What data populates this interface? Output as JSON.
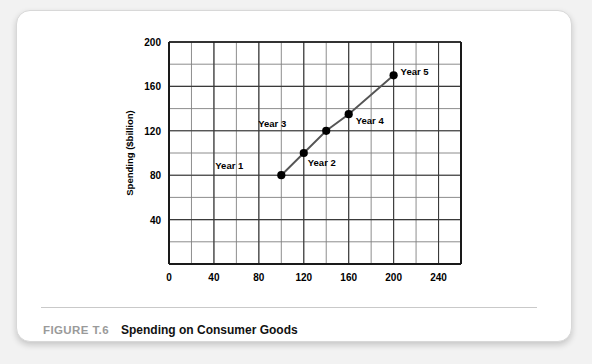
{
  "caption": {
    "figure_number": "FIGURE T.6",
    "title": "Spending on Consumer Goods"
  },
  "chart_data": {
    "type": "line",
    "title": "Spending on Consumer Goods",
    "xlabel": "Disposable income ($billion)",
    "ylabel": "Spending ($billion)",
    "xlim": [
      0,
      260
    ],
    "ylim": [
      0,
      200
    ],
    "xticks": [
      0,
      40,
      80,
      120,
      160,
      200,
      240
    ],
    "yticks": [
      0,
      40,
      80,
      120,
      160,
      200
    ],
    "xtick_labels": [
      "0",
      "40",
      "80",
      "120",
      "160",
      "200",
      "240"
    ],
    "ytick_labels": [
      "0",
      "40",
      "80",
      "120",
      "160",
      "200"
    ],
    "x_minor_step": 20,
    "y_minor_step": 20,
    "grid": true,
    "legend": false,
    "marker": "filled-circle",
    "line_color": "#555555",
    "marker_color": "#000000",
    "grid_color": "#808080",
    "axis_color": "#1a1a1a",
    "points": [
      {
        "label": "Year 1",
        "x": 100,
        "y": 80,
        "label_dx": -38,
        "label_dy": -6
      },
      {
        "label": "Year 2",
        "x": 120,
        "y": 100,
        "label_dx": 4,
        "label_dy": 13
      },
      {
        "label": "Year 3",
        "x": 140,
        "y": 120,
        "label_dx": -40,
        "label_dy": -4
      },
      {
        "label": "Year 4",
        "x": 160,
        "y": 135,
        "label_dx": 7,
        "label_dy": 10
      },
      {
        "label": "Year 5",
        "x": 200,
        "y": 170,
        "label_dx": 7,
        "label_dy": 0
      }
    ],
    "series": [
      {
        "name": "Spending",
        "x": [
          100,
          120,
          140,
          160,
          200
        ],
        "values": [
          80,
          100,
          120,
          135,
          170
        ]
      }
    ]
  }
}
